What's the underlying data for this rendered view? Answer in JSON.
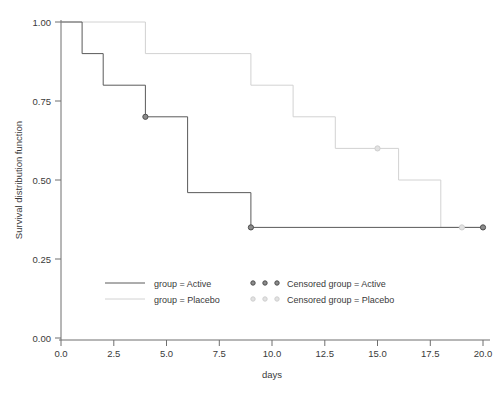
{
  "chart_data": {
    "type": "line",
    "subtype": "kaplan-meier-step",
    "title": "",
    "xlabel": "days",
    "ylabel": "Survival distribution function",
    "xlim": [
      0,
      20
    ],
    "ylim": [
      0,
      1
    ],
    "grid": false,
    "legend_position": "inside-bottom-left",
    "xticks": [
      "0.0",
      "2.5",
      "5.0",
      "7.5",
      "10.0",
      "12.5",
      "15.0",
      "17.5",
      "20.0"
    ],
    "xtick_values": [
      0,
      2.5,
      5,
      7.5,
      10,
      12.5,
      15,
      17.5,
      20
    ],
    "yticks": [
      "0.00",
      "0.25",
      "0.50",
      "0.75",
      "1.00"
    ],
    "ytick_values": [
      0,
      0.25,
      0.5,
      0.75,
      1
    ],
    "series": [
      {
        "name": "group = Active",
        "color": "#5a5a5a",
        "steps_x": [
          0,
          1,
          1,
          2,
          2,
          4,
          4,
          6,
          6,
          9,
          9,
          20
        ],
        "steps_y": [
          1.0,
          1.0,
          0.9,
          0.9,
          0.8,
          0.8,
          0.7,
          0.7,
          0.46,
          0.46,
          0.35,
          0.35
        ],
        "points": [
          {
            "x": 0,
            "y": 1.0
          },
          {
            "x": 1,
            "y": 0.9
          },
          {
            "x": 2,
            "y": 0.8
          },
          {
            "x": 4,
            "y": 0.7
          },
          {
            "x": 6,
            "y": 0.46
          },
          {
            "x": 9,
            "y": 0.35
          },
          {
            "x": 20,
            "y": 0.35
          }
        ]
      },
      {
        "name": "group = Placebo",
        "color": "#d2d2d2",
        "steps_x": [
          0,
          4,
          4,
          9,
          9,
          11,
          11,
          13,
          13,
          16,
          16,
          18,
          18,
          20
        ],
        "steps_y": [
          1.0,
          1.0,
          0.9,
          0.9,
          0.8,
          0.8,
          0.7,
          0.7,
          0.6,
          0.6,
          0.5,
          0.5,
          0.35,
          0.35
        ],
        "points": [
          {
            "x": 0,
            "y": 1.0
          },
          {
            "x": 4,
            "y": 0.9
          },
          {
            "x": 9,
            "y": 0.8
          },
          {
            "x": 11,
            "y": 0.7
          },
          {
            "x": 13,
            "y": 0.6
          },
          {
            "x": 16,
            "y": 0.5
          },
          {
            "x": 18,
            "y": 0.35
          },
          {
            "x": 20,
            "y": 0.35
          }
        ]
      }
    ],
    "censored": [
      {
        "group": "Active",
        "x": 4,
        "y": 0.7
      },
      {
        "group": "Active",
        "x": 9,
        "y": 0.35
      },
      {
        "group": "Active",
        "x": 20,
        "y": 0.35
      },
      {
        "group": "Placebo",
        "x": 15,
        "y": 0.6
      },
      {
        "group": "Placebo",
        "x": 19,
        "y": 0.35
      }
    ]
  },
  "axes": {
    "x_title": "days",
    "y_title": "Survival distribution function",
    "x_tick_labels": [
      "0.0",
      "2.5",
      "5.0",
      "7.5",
      "10.0",
      "12.5",
      "15.0",
      "17.5",
      "20.0"
    ],
    "y_tick_labels": [
      "1.00",
      "0.75",
      "0.50",
      "0.25",
      "0.00"
    ]
  },
  "legend": {
    "entries": [
      {
        "label": "group = Active",
        "kind": "line",
        "color": "#5a5a5a"
      },
      {
        "label": "group = Placebo",
        "kind": "line",
        "color": "#d2d2d2"
      },
      {
        "label": "Censored group = Active",
        "kind": "markers",
        "color": "#8b8b8b"
      },
      {
        "label": "Censored group = Placebo",
        "kind": "markers",
        "color": "#e2e2e2"
      }
    ]
  },
  "colors": {
    "active": "#5a5a5a",
    "placebo": "#d2d2d2",
    "axis": "#6f6f6f",
    "text": "#3a3a3a",
    "background": "#ffffff"
  }
}
